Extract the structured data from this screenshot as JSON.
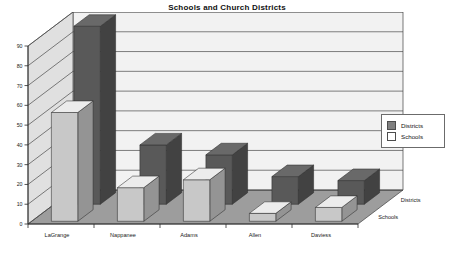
{
  "chart_data": {
    "type": "bar",
    "title": "Schools and Church Districts",
    "xlabel": "",
    "ylabel": "",
    "ylim": [
      0,
      90
    ],
    "ytick_step": 10,
    "yticks": [
      "0",
      "10",
      "20",
      "30",
      "40",
      "50",
      "60",
      "70",
      "80",
      "90"
    ],
    "grid": true,
    "three_d": true,
    "legend_position": "right",
    "depth_axis_labels": [
      "Districts",
      "Schools"
    ],
    "categories": [
      "LaGrange",
      "Nappanee",
      "Adams",
      "Allen",
      "Daviess"
    ],
    "series": [
      {
        "name": "Districts",
        "color": "#595959",
        "values": [
          90,
          30,
          25,
          14,
          12
        ]
      },
      {
        "name": "Schools",
        "color": "#c8c8c8",
        "values": [
          55,
          17,
          21,
          4,
          7
        ]
      }
    ]
  },
  "legend": {
    "entries": [
      {
        "label": "Districts",
        "color": "#808080"
      },
      {
        "label": "Schools",
        "color": "#ffffff"
      }
    ]
  },
  "colors": {
    "back_wall": "#f2f2f2",
    "side_wall": "#e0e0e0",
    "floor": "#9d9d9d",
    "gridline": "#4a4a4a",
    "axis": "#2b2b2b",
    "districts_bar": "#595959",
    "schools_bar": "#c8c8c8",
    "page_background": "#ffffff"
  }
}
